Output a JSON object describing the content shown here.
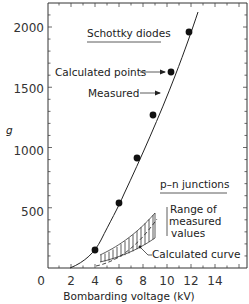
{
  "chart_data": {
    "type": "line",
    "title": "",
    "xlabel": "Bombarding voltage (kV)",
    "ylabel": "g",
    "xlim": [
      0,
      16.7
    ],
    "ylim": [
      0,
      2200
    ],
    "x_ticks": [
      "0",
      "2",
      "4",
      "6",
      "8",
      "10",
      "12",
      "14"
    ],
    "y_ticks": [
      "500",
      "1000",
      "1500",
      "2000"
    ],
    "grid": false,
    "series": [
      {
        "name": "Schottky diodes - Calculated points",
        "style": "markers",
        "x": [
          4,
          6,
          7.5,
          8.8,
          10.3,
          11.8
        ],
        "y": [
          150,
          540,
          910,
          1270,
          1625,
          1960
        ]
      },
      {
        "name": "Schottky diodes - Measured",
        "style": "solid line",
        "x": [
          2,
          3,
          4,
          5,
          6,
          7,
          8,
          9,
          10,
          11,
          12,
          12.4
        ],
        "y": [
          0,
          50,
          150,
          320,
          540,
          790,
          1060,
          1330,
          1580,
          1800,
          2010,
          2120
        ]
      },
      {
        "name": "p-n junctions - Range of measured values (upper)",
        "style": "hatched band",
        "x": [
          4.4,
          5,
          6,
          7,
          8,
          9
        ],
        "y": [
          110,
          150,
          230,
          330,
          440,
          560
        ]
      },
      {
        "name": "p-n junctions - Range of measured values (lower)",
        "style": "hatched band",
        "x": [
          4.4,
          5,
          6,
          7,
          8,
          9
        ],
        "y": [
          50,
          65,
          95,
          140,
          200,
          290
        ]
      },
      {
        "name": "p-n junctions - Calculated curve",
        "style": "dashed line",
        "x": [
          4,
          5,
          6,
          7,
          8,
          9
        ],
        "y": [
          20,
          45,
          100,
          180,
          280,
          410
        ]
      }
    ],
    "annotations": [
      "Schottky diodes",
      "Calculated points",
      "Measured",
      "p-n junctions",
      "Range of measured values",
      "Calculated curve"
    ]
  },
  "labels": {
    "y_axis": "g",
    "x_axis": "Bombarding voltage (kV)",
    "x_ticks": [
      "0",
      "2",
      "4",
      "6",
      "8",
      "10",
      "12",
      "14"
    ],
    "y_ticks": [
      "500",
      "1000",
      "1500",
      "2000"
    ],
    "schottky_title": "Schottky diodes",
    "calc_points": "Calculated points",
    "measured": "Measured",
    "pn_title": "p–n junctions",
    "range_line1": "Range of",
    "range_line2": "measured",
    "range_line3": "values",
    "calc_curve": "Calculated curve"
  }
}
